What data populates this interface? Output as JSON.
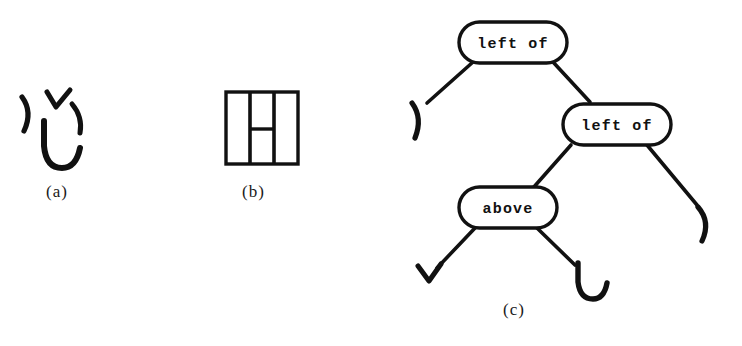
{
  "figure": {
    "background_color": "#ffffff",
    "ink_color": "#111111",
    "width": 742,
    "height": 346
  },
  "panels": [
    {
      "id": "a",
      "caption": "(a)",
      "description": "face composed of four primitive strokes",
      "strokes": [
        {
          "name": "right-paren-left",
          "glyph": ")"
        },
        {
          "name": "vee-top",
          "glyph": "v"
        },
        {
          "name": "right-paren-right",
          "glyph": ")"
        },
        {
          "name": "u-curve-mouth",
          "glyph": "u"
        }
      ]
    },
    {
      "id": "b",
      "caption": "(b)",
      "description": "letter H inscribed in a square",
      "strokes": [
        {
          "name": "outer-square",
          "glyph": "square"
        },
        {
          "name": "vertical-bar-left",
          "glyph": "|"
        },
        {
          "name": "vertical-bar-right",
          "glyph": "|"
        },
        {
          "name": "crossbar",
          "glyph": "-"
        }
      ]
    },
    {
      "id": "c",
      "caption": "(c)",
      "description": "structural description parse tree"
    }
  ],
  "tree": {
    "nodes": [
      {
        "id": "n1",
        "label": "left of",
        "level": 0
      },
      {
        "id": "n2",
        "label": "left of",
        "level": 1
      },
      {
        "id": "n3",
        "label": "above",
        "level": 2
      }
    ],
    "leaves": [
      {
        "id": "l1",
        "glyph": ")",
        "name": "right-paren-leaf-outer-left"
      },
      {
        "id": "l2",
        "glyph": ")",
        "name": "right-paren-leaf-outer-right"
      },
      {
        "id": "l3",
        "glyph": "v",
        "name": "vee-leaf"
      },
      {
        "id": "l4",
        "glyph": "u",
        "name": "u-curve-leaf"
      }
    ],
    "edges": [
      {
        "from": "n1",
        "to": "l1"
      },
      {
        "from": "n1",
        "to": "n2"
      },
      {
        "from": "n2",
        "to": "n3"
      },
      {
        "from": "n2",
        "to": "l2"
      },
      {
        "from": "n3",
        "to": "l3"
      },
      {
        "from": "n3",
        "to": "l4"
      }
    ]
  }
}
